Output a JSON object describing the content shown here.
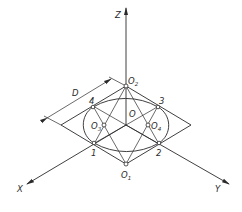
{
  "diagram": {
    "type": "isometric-circle-four-center-construction",
    "axes": {
      "z": "Z",
      "x": "X",
      "y": "Y"
    },
    "dimension": {
      "label": "D"
    },
    "points": {
      "center": "O",
      "o1": {
        "base": "O",
        "sub": "1"
      },
      "o2": {
        "base": "O",
        "sub": "2"
      },
      "o3": {
        "base": "O",
        "sub": "3"
      },
      "o4": {
        "base": "O",
        "sub": "4"
      },
      "p1": "1",
      "p2": "2",
      "p3": "3",
      "p4": "4"
    },
    "colors": {
      "line": "#2a2a2a",
      "background": "#ffffff"
    }
  }
}
